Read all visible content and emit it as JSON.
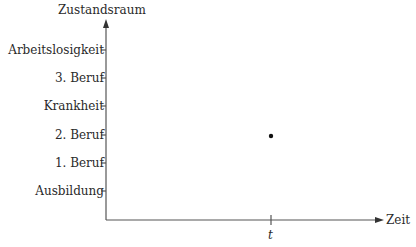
{
  "diagram": {
    "y_axis": {
      "title": "Zustandsraum",
      "states": [
        {
          "label": "Arbeitslosigkeit",
          "y": 50
        },
        {
          "label": "3. Beruf",
          "y": 78
        },
        {
          "label": "Krankheit",
          "y": 106
        },
        {
          "label": "2. Beruf",
          "y": 135
        },
        {
          "label": "1. Beruf",
          "y": 163
        },
        {
          "label": "Ausbildung",
          "y": 191
        }
      ]
    },
    "x_axis": {
      "title": "Zeit",
      "tick_label": "t"
    },
    "point": {
      "time": "t",
      "state": "2. Beruf"
    },
    "colors": {
      "axis": "#555555",
      "text": "#2a2a2a",
      "point": "#111111"
    }
  }
}
